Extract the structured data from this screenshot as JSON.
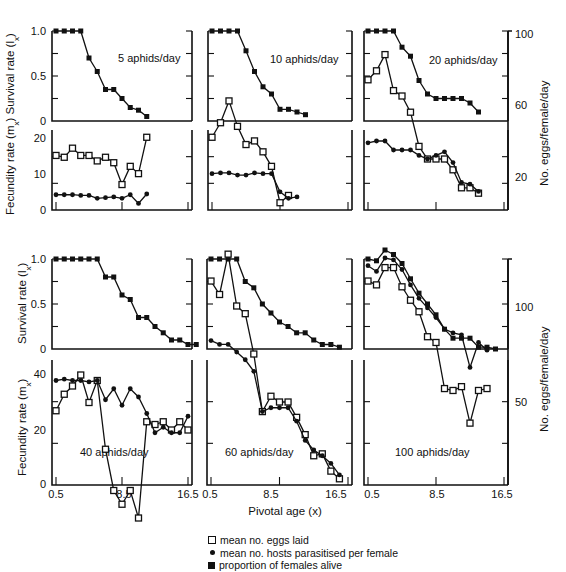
{
  "figure": {
    "x_axis_label": "Pivotal age (x)",
    "left_axis_top_label": "Survival rate (l",
    "left_axis_top_sub": "x",
    "left_axis_bottom_label": "Fecundity rate (m",
    "left_axis_bottom_sub": "x",
    "right_axis_label": "No. eggs/female/day",
    "x_ticks": [
      "0.5",
      "8.5",
      "16.5"
    ],
    "top_row_survival_ticks": [
      "1.0",
      "0.5",
      "0"
    ],
    "top_row_fecundity_ticks": [
      "20",
      "10",
      "0"
    ],
    "top_row_right_ticks": [
      "100",
      "60",
      "20"
    ],
    "bottom_row_survival_ticks": [
      "1.0",
      "0.5",
      "0"
    ],
    "bottom_row_fecundity_ticks": [
      "40",
      "20",
      "0"
    ],
    "bottom_row_right_ticks": [
      "100",
      "50"
    ]
  },
  "legend": [
    {
      "symbol": "open-square",
      "label": "mean no. eggs laid"
    },
    {
      "symbol": "dot",
      "label": "mean no. hosts parasitised per female"
    },
    {
      "symbol": "filled-square",
      "label": "proportion of females alive"
    }
  ],
  "chart_data": [
    {
      "type": "line",
      "title": "5 aphids/day",
      "xlabel": "Pivotal age (x)",
      "ylabel": "Survival rate (lx) / Fecundity rate (mx)",
      "x": [
        0.5,
        1.5,
        2.5,
        3.5,
        4.5,
        5.5,
        6.5,
        7.5,
        8.5,
        9.5,
        10.5,
        11.5
      ],
      "series": [
        {
          "name": "proportion of females alive",
          "axis": "survival",
          "values": [
            1.0,
            1.0,
            1.0,
            1.0,
            0.7,
            0.55,
            0.35,
            0.35,
            0.25,
            0.15,
            0.12,
            0.05
          ]
        },
        {
          "name": "mean no. eggs laid",
          "axis": "fecundity",
          "values": [
            15,
            14.5,
            17,
            15,
            15,
            13.5,
            14.5,
            13,
            7,
            12,
            10,
            20
          ]
        },
        {
          "name": "mean no. hosts parasitised per female",
          "axis": "fecundity",
          "values": [
            4.2,
            4.2,
            4.2,
            4,
            4,
            3.2,
            3.4,
            3.6,
            3.2,
            4.2,
            1.8,
            4.4
          ]
        }
      ],
      "ylim_survival": [
        0,
        1.0
      ],
      "ylim_fecundity": [
        0,
        22
      ]
    },
    {
      "type": "line",
      "title": "10 aphids/day",
      "xlabel": "Pivotal age (x)",
      "x": [
        0.5,
        1.5,
        2.5,
        3.5,
        4.5,
        5.5,
        6.5,
        7.5,
        8.5,
        9.5,
        10.5,
        11.5
      ],
      "series": [
        {
          "name": "proportion of females alive",
          "axis": "survival",
          "values": [
            1.0,
            1.0,
            1.0,
            1.0,
            0.78,
            0.55,
            0.38,
            0.3,
            0.13,
            0.13,
            0.1,
            0.07
          ]
        },
        {
          "name": "mean no. eggs laid",
          "axis": "fecundity",
          "values": [
            20,
            24,
            30,
            23,
            18,
            19,
            16,
            12,
            2,
            4
          ]
        },
        {
          "name": "mean no. hosts parasitised per female",
          "axis": "fecundity",
          "values": [
            10,
            10.2,
            10.2,
            9.6,
            9.6,
            10.2,
            10,
            10,
            5,
            3.2,
            3.6
          ]
        }
      ],
      "ylim_survival": [
        0,
        1.0
      ],
      "ylim_fecundity": [
        0,
        22
      ]
    },
    {
      "type": "line",
      "title": "20 aphids/day",
      "xlabel": "Pivotal age (x)",
      "y2label": "No. eggs/female/day",
      "x": [
        0.5,
        1.5,
        2.5,
        3.5,
        4.5,
        5.5,
        6.5,
        7.5,
        8.5,
        9.5,
        10.5,
        11.5,
        12.5,
        13.5
      ],
      "series": [
        {
          "name": "proportion of females alive",
          "axis": "survival",
          "values": [
            1.0,
            1.0,
            1.0,
            1.0,
            0.82,
            0.72,
            0.45,
            0.3,
            0.25,
            0.25,
            0.25,
            0.25,
            0.2,
            0.1
          ]
        },
        {
          "name": "mean no. eggs laid",
          "axis": "eggs_per_female_day",
          "values": [
            74,
            79,
            88,
            68,
            65,
            56,
            37,
            30,
            30,
            30,
            24,
            14,
            14,
            11
          ]
        },
        {
          "name": "mean no. hosts parasitised per female",
          "axis": "fecundity",
          "values": [
            39,
            40,
            40,
            35,
            35,
            35,
            32,
            30,
            32,
            34,
            28,
            17,
            16,
            12
          ]
        }
      ],
      "ylim_survival": [
        0,
        1.0
      ],
      "y2lim": [
        0,
        105
      ]
    },
    {
      "type": "line",
      "title": "40 aphids/day",
      "xlabel": "Pivotal age (x)",
      "x": [
        0.5,
        1.5,
        2.5,
        3.5,
        4.5,
        5.5,
        6.5,
        7.5,
        8.5,
        9.5,
        10.5,
        11.5,
        12.5,
        13.5,
        14.5,
        15.5,
        16.5
      ],
      "series": [
        {
          "name": "proportion of females alive",
          "axis": "survival",
          "values": [
            1.0,
            1.0,
            1.0,
            1.0,
            1.0,
            1.0,
            0.8,
            0.8,
            0.6,
            0.55,
            0.35,
            0.35,
            0.25,
            0.18,
            0.1,
            0.1,
            0.05,
            0.05
          ]
        },
        {
          "name": "mean no. eggs laid",
          "axis": "fecundity",
          "values": [
            27,
            33,
            36,
            40,
            30,
            38,
            13,
            -2,
            -7,
            -2,
            -12,
            23,
            22,
            23,
            20,
            23,
            20
          ]
        },
        {
          "name": "mean no. hosts parasitised per female",
          "axis": "fecundity",
          "values": [
            38,
            38.5,
            38,
            38,
            37.5,
            38,
            31,
            35,
            29,
            35,
            32,
            26,
            19,
            21,
            19,
            19,
            25
          ]
        }
      ],
      "ylim_survival": [
        0,
        1.0
      ],
      "ylim_fecundity": [
        0,
        45
      ]
    },
    {
      "type": "line",
      "title": "60 aphids/day",
      "xlabel": "Pivotal age (x)",
      "x": [
        0.5,
        1.5,
        2.5,
        3.5,
        4.5,
        5.5,
        6.5,
        7.5,
        8.5,
        9.5,
        10.5,
        11.5,
        12.5,
        13.5,
        14.5,
        15.5,
        16.5
      ],
      "series": [
        {
          "name": "proportion of females alive",
          "axis": "survival",
          "values": [
            1.0,
            1.0,
            1.0,
            1.0,
            0.75,
            0.68,
            0.5,
            0.4,
            0.3,
            0.25,
            0.18,
            0.18,
            0.1,
            0.05,
            0.05,
            0.02
          ]
        },
        {
          "name": "mean no. eggs laid",
          "axis": "eggs_per_female_day",
          "values": [
            113,
            106,
            127,
            100,
            96,
            75,
            45,
            53,
            50,
            50,
            42,
            33,
            22,
            23,
            14,
            10
          ]
        },
        {
          "name": "mean no. hosts parasitised per female",
          "axis": "eggs_per_female_day",
          "values": [
            82,
            80,
            80,
            76,
            72,
            66,
            45,
            47,
            47,
            47,
            40,
            30,
            25,
            22,
            18,
            12
          ]
        }
      ],
      "ylim_survival": [
        0,
        1.0
      ],
      "y2lim": [
        0,
        140
      ]
    },
    {
      "type": "line",
      "title": "100 aphids/day",
      "xlabel": "Pivotal age (x)",
      "y2label": "No. eggs/female/day",
      "x": [
        0.5,
        1.5,
        2.5,
        3.5,
        4.5,
        5.5,
        6.5,
        7.5,
        8.5,
        9.5,
        10.5,
        11.5,
        12.5,
        13.5,
        14.5,
        15.5,
        16.5
      ],
      "series": [
        {
          "name": "proportion of females alive",
          "axis": "survival",
          "values": [
            1.0,
            0.98,
            1.1,
            1.05,
            0.95,
            0.78,
            0.62,
            0.5,
            0.38,
            0.22,
            0.12,
            0.12,
            0.12,
            0.02,
            0.02,
            0.0
          ]
        },
        {
          "name": "mean no. eggs laid",
          "axis": "eggs_per_female_day",
          "values": [
            113,
            111,
            120,
            120,
            110,
            103,
            97,
            84,
            81,
            57,
            56,
            58,
            39,
            56,
            57
          ]
        },
        {
          "name": "mean no. hosts parasitised per female",
          "axis": "eggs_per_female_day",
          "values": [
            121,
            118,
            125,
            124,
            119,
            111,
            104,
            99,
            94,
            88,
            86,
            85,
            68,
            81,
            77
          ]
        }
      ],
      "ylim_survival": [
        0,
        1.0
      ],
      "y2lim": [
        30,
        125
      ]
    }
  ]
}
